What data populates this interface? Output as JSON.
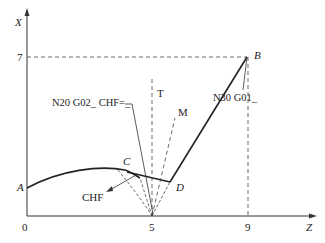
{
  "diagram": {
    "axes": {
      "x_label": "X",
      "z_label": "Z",
      "origin_label": "0",
      "x_ticks": [
        "7"
      ],
      "z_ticks": [
        "5",
        "9"
      ]
    },
    "points": {
      "A": "A",
      "B": "B",
      "C": "C",
      "D": "D"
    },
    "annotations": {
      "n20": "N20  G02_ CHF=_",
      "n30": "N30  G01_",
      "t": "T",
      "m": "M",
      "chf": "CHF"
    },
    "colors": {
      "line": "#222222",
      "background": "#ffffff"
    }
  }
}
